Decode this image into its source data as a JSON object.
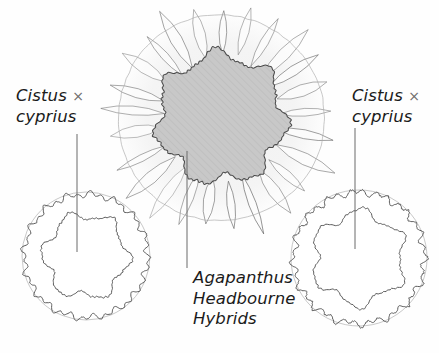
{
  "diagram": {
    "type": "garden-planting-plan",
    "background_color": "#fefefe",
    "width": 439,
    "height": 353
  },
  "labels": {
    "cistus_left": {
      "line1": "Cistus ",
      "symbol": "×",
      "line2": "cyprius",
      "leader_line": {
        "x": 77,
        "y1": 134,
        "y2": 252
      }
    },
    "cistus_right": {
      "line1": "Cistus ",
      "symbol": "×",
      "line2": "cyprius",
      "leader_line": {
        "x": 355,
        "y1": 128,
        "y2": 249
      }
    },
    "agapanthus": {
      "line1": "Agapanthus",
      "line2": "Headbourne",
      "line3": "Hybrids",
      "leader_line": {
        "x": 187,
        "y1": 151,
        "y2": 268
      }
    }
  },
  "colors": {
    "ink": "#5e5e5e",
    "ink_dark": "#4a4a4a",
    "ink_light": "#a8a8a8",
    "clump_fill": "#c8c8c8",
    "clump_hatch": "#a4a4a4",
    "halo_fill": "#f4f4f4",
    "leaf_fill": "#fbfbfb",
    "text": "#1b1b1b"
  },
  "plants": [
    {
      "name": "Agapanthus Headbourne Hybrids",
      "role": "central-clump",
      "shape": "cloud-blob-hatched",
      "center": {
        "x": 221,
        "y": 118
      },
      "blob_radius": 63,
      "blob_lobes": 7,
      "halo_radius": 104,
      "ring_radius": 103,
      "leaf_count": 25,
      "leaf_inner": 62,
      "leaf_outer": 118,
      "leaf_half_width": 9
    },
    {
      "name": "Cistus × cyprius",
      "role": "left-shrub",
      "shape": "outline-circle-with-inner-cloud",
      "center": {
        "x": 86,
        "y": 256
      },
      "outer_radius": 64,
      "inner_radius": 41,
      "inner_lobes": 6
    },
    {
      "name": "Cistus × cyprius",
      "role": "right-shrub",
      "shape": "outline-circle-with-inner-cloud",
      "center": {
        "x": 359,
        "y": 258
      },
      "outer_radius": 68,
      "inner_radius": 45,
      "inner_lobes": 6
    }
  ]
}
